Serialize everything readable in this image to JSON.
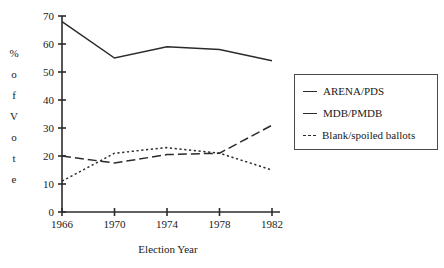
{
  "chart_data": {
    "type": "line",
    "title": "",
    "xlabel": "Election Year",
    "ylabel": "% of Vote",
    "ylabel_letters": [
      "%",
      "o",
      "f",
      "V",
      "o",
      "t",
      "e"
    ],
    "categories": [
      "1966",
      "1970",
      "1974",
      "1978",
      "1982"
    ],
    "x": [
      1966,
      1970,
      1974,
      1978,
      1982
    ],
    "xlim": [
      1966,
      1982
    ],
    "ylim": [
      0,
      70
    ],
    "ytick_labels": [
      "0",
      "10",
      "20",
      "30",
      "40",
      "50",
      "60",
      "70"
    ],
    "yticks": [
      0,
      10,
      20,
      30,
      40,
      50,
      60,
      70
    ],
    "grid": false,
    "legend_position": "right",
    "series": [
      {
        "name": "ARENA/PDS",
        "style": "solid",
        "color": "#2b2b2b",
        "values": [
          68,
          55,
          59,
          58,
          54
        ]
      },
      {
        "name": "MDB/PMDB",
        "style": "dashed",
        "color": "#2b2b2b",
        "values": [
          20,
          17.5,
          20.5,
          21,
          31
        ]
      },
      {
        "name": "Blank/spoiled ballots",
        "style": "dotted",
        "color": "#2b2b2b",
        "values": [
          11,
          21,
          23,
          21,
          15
        ]
      }
    ]
  },
  "axes": {
    "x_title": "Election Year"
  },
  "legend": {
    "entries": [
      {
        "label": "ARENA/PDS"
      },
      {
        "label": "MDB/PMDB"
      },
      {
        "label": "Blank/spoiled ballots"
      }
    ]
  }
}
